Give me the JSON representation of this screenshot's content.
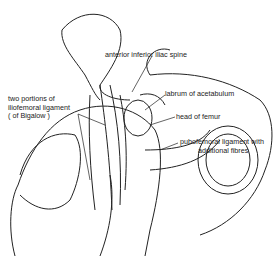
{
  "diagram": {
    "labels": [
      {
        "id": "aiis",
        "text": "anterior inferior iliac spine"
      },
      {
        "id": "labrum",
        "text": "labrum of acetabulum"
      },
      {
        "id": "head",
        "text": "head of femur"
      },
      {
        "id": "pubofemoral",
        "lines": [
          "pubofemoral ligament with",
          "additional fibres"
        ]
      },
      {
        "id": "iliofemoral",
        "lines": [
          "two portions of",
          "iliofemoral ligament",
          "( of Bigalow )"
        ]
      }
    ]
  }
}
